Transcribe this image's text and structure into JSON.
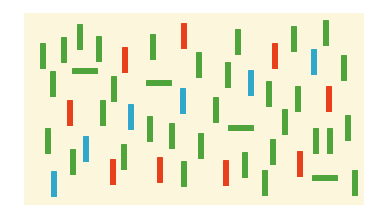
{
  "board": {
    "background": "#fbf6dc",
    "origin": [
      24,
      13
    ],
    "size": [
      340,
      192
    ]
  },
  "palette": {
    "green": "#4fa53c",
    "red": "#e8401c",
    "blue": "#2fa8cc"
  },
  "items": [
    {
      "color": "green",
      "orient": "v",
      "x": 40,
      "y": 43
    },
    {
      "color": "green",
      "orient": "v",
      "x": 61,
      "y": 37
    },
    {
      "color": "green",
      "orient": "v",
      "x": 77,
      "y": 24
    },
    {
      "color": "green",
      "orient": "v",
      "x": 96,
      "y": 36
    },
    {
      "color": "red",
      "orient": "v",
      "x": 122,
      "y": 47
    },
    {
      "color": "green",
      "orient": "v",
      "x": 150,
      "y": 34
    },
    {
      "color": "red",
      "orient": "v",
      "x": 181,
      "y": 23
    },
    {
      "color": "green",
      "orient": "v",
      "x": 50,
      "y": 71
    },
    {
      "color": "green",
      "orient": "h",
      "x": 72,
      "y": 68
    },
    {
      "color": "green",
      "orient": "v",
      "x": 111,
      "y": 76
    },
    {
      "color": "green",
      "orient": "h",
      "x": 146,
      "y": 80
    },
    {
      "color": "blue",
      "orient": "v",
      "x": 180,
      "y": 88
    },
    {
      "color": "green",
      "orient": "v",
      "x": 196,
      "y": 52
    },
    {
      "color": "green",
      "orient": "v",
      "x": 235,
      "y": 29
    },
    {
      "color": "red",
      "orient": "v",
      "x": 272,
      "y": 43
    },
    {
      "color": "green",
      "orient": "v",
      "x": 291,
      "y": 26
    },
    {
      "color": "green",
      "orient": "v",
      "x": 323,
      "y": 20
    },
    {
      "color": "green",
      "orient": "v",
      "x": 225,
      "y": 62
    },
    {
      "color": "blue",
      "orient": "v",
      "x": 248,
      "y": 70
    },
    {
      "color": "blue",
      "orient": "v",
      "x": 311,
      "y": 49
    },
    {
      "color": "green",
      "orient": "v",
      "x": 341,
      "y": 55
    },
    {
      "color": "green",
      "orient": "v",
      "x": 266,
      "y": 81
    },
    {
      "color": "green",
      "orient": "v",
      "x": 295,
      "y": 86
    },
    {
      "color": "red",
      "orient": "v",
      "x": 326,
      "y": 86
    },
    {
      "color": "green",
      "orient": "v",
      "x": 213,
      "y": 97
    },
    {
      "color": "red",
      "orient": "v",
      "x": 67,
      "y": 100
    },
    {
      "color": "green",
      "orient": "v",
      "x": 100,
      "y": 100
    },
    {
      "color": "blue",
      "orient": "v",
      "x": 128,
      "y": 104
    },
    {
      "color": "green",
      "orient": "v",
      "x": 147,
      "y": 116
    },
    {
      "color": "green",
      "orient": "v",
      "x": 169,
      "y": 123
    },
    {
      "color": "green",
      "orient": "v",
      "x": 45,
      "y": 128
    },
    {
      "color": "green",
      "orient": "v",
      "x": 70,
      "y": 149
    },
    {
      "color": "blue",
      "orient": "v",
      "x": 83,
      "y": 136
    },
    {
      "color": "red",
      "orient": "v",
      "x": 110,
      "y": 159
    },
    {
      "color": "green",
      "orient": "v",
      "x": 121,
      "y": 144
    },
    {
      "color": "red",
      "orient": "v",
      "x": 157,
      "y": 157
    },
    {
      "color": "green",
      "orient": "v",
      "x": 181,
      "y": 161
    },
    {
      "color": "blue",
      "orient": "v",
      "x": 51,
      "y": 171
    },
    {
      "color": "green",
      "orient": "h",
      "x": 228,
      "y": 125
    },
    {
      "color": "green",
      "orient": "v",
      "x": 282,
      "y": 109
    },
    {
      "color": "green",
      "orient": "v",
      "x": 198,
      "y": 133
    },
    {
      "color": "green",
      "orient": "v",
      "x": 270,
      "y": 139
    },
    {
      "color": "green",
      "orient": "v",
      "x": 313,
      "y": 128
    },
    {
      "color": "green",
      "orient": "v",
      "x": 327,
      "y": 128
    },
    {
      "color": "green",
      "orient": "v",
      "x": 345,
      "y": 115
    },
    {
      "color": "red",
      "orient": "v",
      "x": 223,
      "y": 160
    },
    {
      "color": "green",
      "orient": "v",
      "x": 242,
      "y": 152
    },
    {
      "color": "green",
      "orient": "v",
      "x": 262,
      "y": 170
    },
    {
      "color": "red",
      "orient": "v",
      "x": 297,
      "y": 151
    },
    {
      "color": "green",
      "orient": "h",
      "x": 312,
      "y": 175
    },
    {
      "color": "green",
      "orient": "v",
      "x": 352,
      "y": 170
    }
  ]
}
